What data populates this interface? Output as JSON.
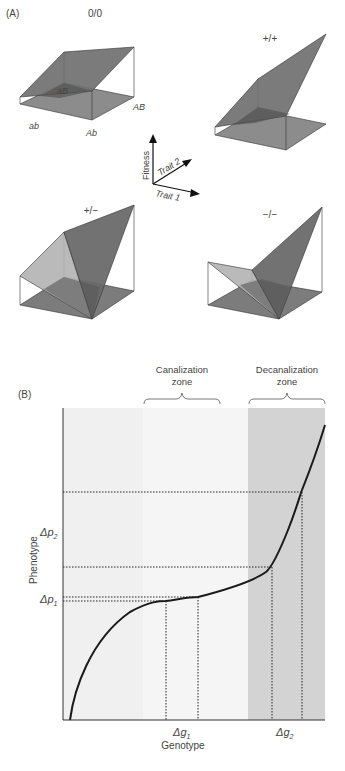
{
  "panel_a": {
    "label": "(A)",
    "landscapes": [
      {
        "title": "0/0",
        "genotype_labels": {
          "ab": "ab",
          "aB": "aB",
          "Ab": "Ab",
          "AB": "AB"
        }
      },
      {
        "title": "+/+"
      },
      {
        "title": "+/−"
      },
      {
        "title": "−/−"
      }
    ],
    "axes": {
      "fitness": "Fitness",
      "trait1": "Trait 1",
      "trait2": "Trait 2"
    }
  },
  "panel_b": {
    "label": "(B)",
    "zones": [
      {
        "title_line1": "Canalization",
        "title_line2": "zone"
      },
      {
        "title_line1": "Decanalization",
        "title_line2": "zone"
      }
    ],
    "y_axis_label": "Phenotype",
    "x_axis_label": "Genotype",
    "y_ticks": [
      "Δp2",
      "Δp1"
    ],
    "x_ticks": [
      "Δg1",
      "Δg2"
    ],
    "y_tick_parts": [
      {
        "base": "Δp",
        "sub": "2"
      },
      {
        "base": "Δp",
        "sub": "1"
      }
    ],
    "x_tick_parts": [
      {
        "base": "Δg",
        "sub": "1"
      },
      {
        "base": "Δg",
        "sub": "2"
      }
    ]
  },
  "colors": {
    "plane_dark": "#6e6e6e",
    "plane_mid": "#8a8a8a",
    "plane_light": "#b0b0b0",
    "zone_light": "#efefef",
    "zone_mid": "#f4f4f4",
    "zone_dark": "#d2d2d2",
    "curve": "#1a1a1a"
  }
}
